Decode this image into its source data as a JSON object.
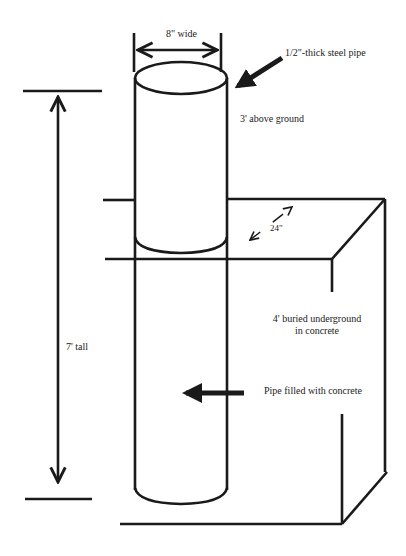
{
  "diagram": {
    "type": "technical-sketch",
    "labels": {
      "width": "8\" wide",
      "pipe_thickness": "1/2\"-thick steel pipe",
      "above_ground": "3' above ground",
      "depth": "24\"",
      "buried_line1": "4' buried underground",
      "buried_line2": "in concrete",
      "filled": "Pipe filled with concrete",
      "total_height": "7' tall"
    },
    "colors": {
      "stroke": "#1a1a1a",
      "background": "#ffffff"
    }
  }
}
